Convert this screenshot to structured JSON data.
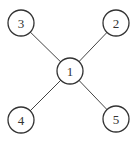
{
  "diagram": {
    "type": "star-graph",
    "nodes": [
      {
        "id": "1",
        "label": "1",
        "cx": 70,
        "cy": 71,
        "r": 13
      },
      {
        "id": "2",
        "label": "2",
        "cx": 116,
        "cy": 23,
        "r": 13
      },
      {
        "id": "3",
        "label": "3",
        "cx": 21,
        "cy": 23,
        "r": 13
      },
      {
        "id": "4",
        "label": "4",
        "cx": 21,
        "cy": 120,
        "r": 13
      },
      {
        "id": "5",
        "label": "5",
        "cx": 116,
        "cy": 119,
        "r": 13
      }
    ],
    "edges": [
      {
        "from": "1",
        "to": "2"
      },
      {
        "from": "1",
        "to": "3"
      },
      {
        "from": "1",
        "to": "4"
      },
      {
        "from": "1",
        "to": "5"
      }
    ]
  }
}
